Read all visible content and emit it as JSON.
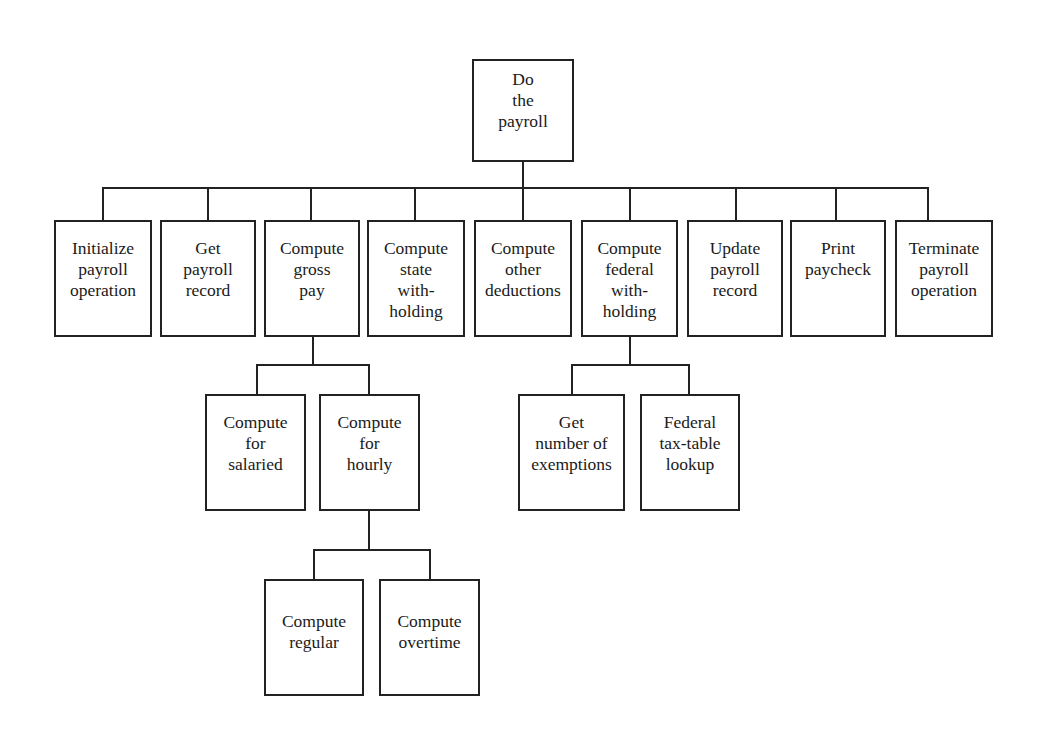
{
  "diagram": {
    "type": "hierarchy-chart",
    "root": {
      "id": "do_payroll",
      "lines": [
        "Do",
        "the",
        "payroll"
      ]
    },
    "level1": [
      {
        "id": "initialize",
        "lines": [
          "Initialize",
          "payroll",
          "operation"
        ]
      },
      {
        "id": "get_record",
        "lines": [
          "Get",
          "payroll",
          "record"
        ]
      },
      {
        "id": "gross_pay",
        "lines": [
          "Compute",
          "gross",
          "pay"
        ]
      },
      {
        "id": "state_withholding",
        "lines": [
          "Compute",
          "state",
          "with-",
          "holding"
        ]
      },
      {
        "id": "other_deductions",
        "lines": [
          "Compute",
          "other",
          "deductions"
        ]
      },
      {
        "id": "federal_withholding",
        "lines": [
          "Compute",
          "federal",
          "with-",
          "holding"
        ]
      },
      {
        "id": "update_record",
        "lines": [
          "Update",
          "payroll",
          "record"
        ]
      },
      {
        "id": "print_paycheck",
        "lines": [
          "Print",
          "paycheck"
        ]
      },
      {
        "id": "terminate",
        "lines": [
          "Terminate",
          "payroll",
          "operation"
        ]
      }
    ],
    "gross_pay_children": [
      {
        "id": "salaried",
        "lines": [
          "Compute",
          "for",
          "salaried"
        ]
      },
      {
        "id": "hourly",
        "lines": [
          "Compute",
          "for",
          "hourly"
        ]
      }
    ],
    "federal_children": [
      {
        "id": "exemptions",
        "lines": [
          "Get",
          "number of",
          "exemptions"
        ]
      },
      {
        "id": "tax_table",
        "lines": [
          "Federal",
          "tax-table",
          "lookup"
        ]
      }
    ],
    "hourly_children": [
      {
        "id": "regular",
        "lines": [
          "Compute",
          "regular"
        ]
      },
      {
        "id": "overtime",
        "lines": [
          "Compute",
          "overtime"
        ]
      }
    ]
  }
}
